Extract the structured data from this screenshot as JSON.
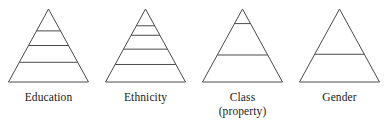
{
  "figure": {
    "type": "diagram",
    "subtype": "stratification-pyramids",
    "background_color": "#ffffff",
    "stroke_color": "#4a4a4a",
    "text_color": "#1a1a1a",
    "pyramids": [
      {
        "id": "education",
        "label": "Education",
        "label_line2": "",
        "divider_count": 3,
        "strata_count": 4,
        "divider_positions": [
          0.3,
          0.5,
          0.73
        ]
      },
      {
        "id": "ethnicity",
        "label": "Ethnicity",
        "label_line2": "",
        "divider_count": 4,
        "strata_count": 5,
        "divider_positions": [
          0.23,
          0.36,
          0.55,
          0.76
        ]
      },
      {
        "id": "class-property",
        "label": "Class",
        "label_line2": "(property)",
        "divider_count": 2,
        "strata_count": 3,
        "divider_positions": [
          0.2,
          0.63
        ]
      },
      {
        "id": "gender",
        "label": "Gender",
        "label_line2": "",
        "divider_count": 1,
        "strata_count": 2,
        "divider_positions": [
          0.62
        ]
      }
    ]
  }
}
